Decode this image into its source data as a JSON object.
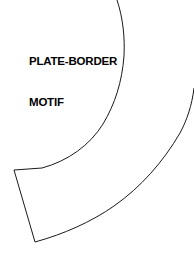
{
  "sheet": {
    "background_color": "#ffffff",
    "width": 194,
    "height": 267
  },
  "label": {
    "line1": "PLATE-BORDER",
    "line2": "MOTIF",
    "full_text": "PLATE-BORDER MOTIF",
    "color": "#000000"
  },
  "motif": {
    "name": "plate-border-motif-template",
    "description": "Curved arc-segment pattern piece",
    "stroke_color": "#1a1a1a",
    "fill_color": "#ffffff",
    "stroke_width": 1,
    "inner_arc": {
      "start": [
        117,
        0
      ],
      "end": [
        14,
        170
      ],
      "radius": 168
    },
    "outer_arc": {
      "start": [
        194,
        88
      ],
      "end": [
        35,
        242
      ],
      "radius": 243
    },
    "radial_edge": {
      "start": [
        14,
        170
      ],
      "end": [
        35,
        242
      ]
    }
  }
}
